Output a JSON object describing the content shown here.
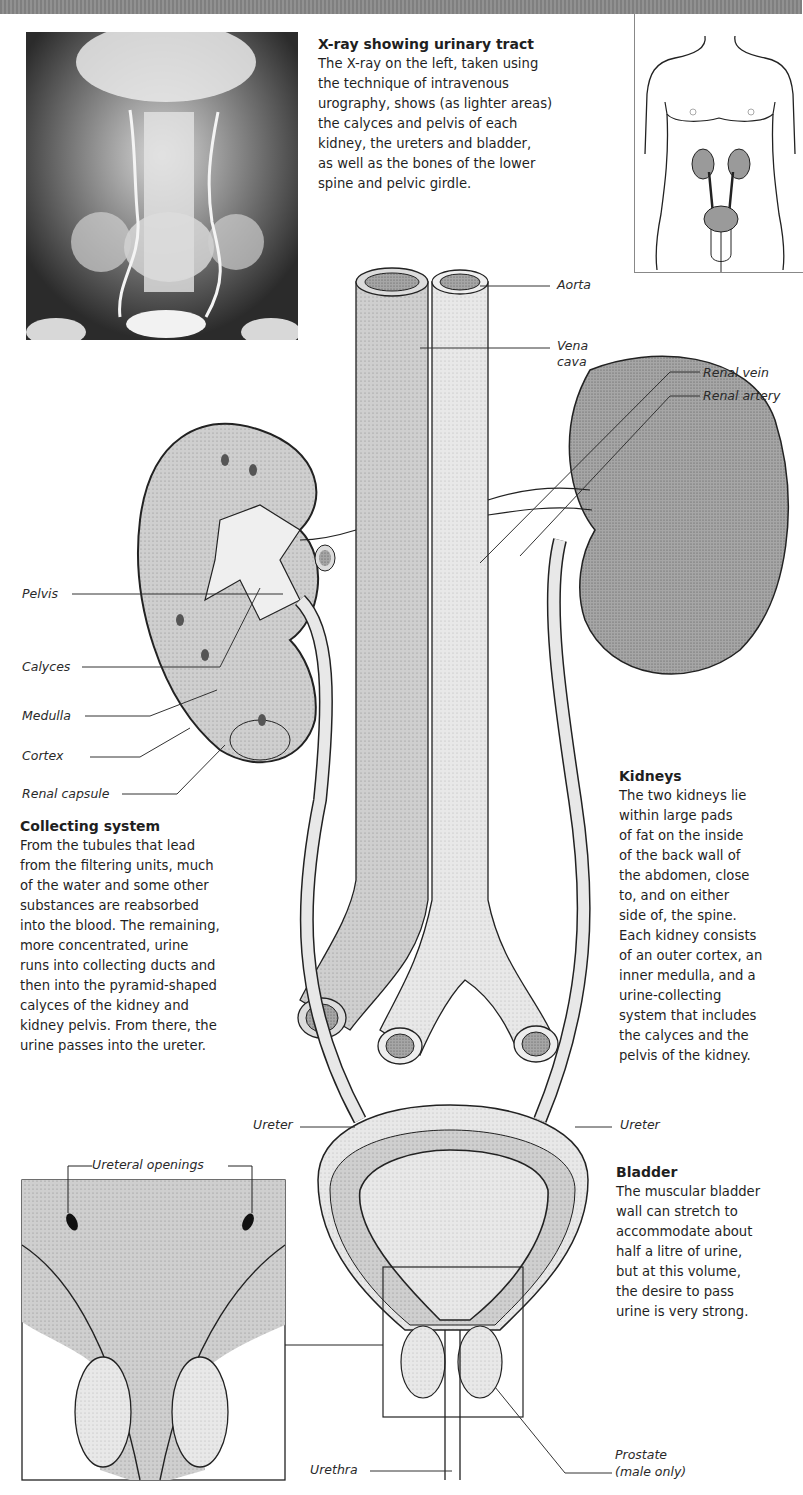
{
  "xray_caption": {
    "title": "X-ray showing urinary tract",
    "lines": [
      "The X-ray on the left, taken using",
      "the technique of intravenous",
      "urography, shows (as lighter areas)",
      "the calyces and pelvis of each",
      "kidney, the ureters and bladder,",
      "as well as the bones of the lower",
      "spine and pelvic girdle."
    ]
  },
  "labels": {
    "aorta": "Aorta",
    "vena_cava_1": "Vena",
    "vena_cava_2": "cava",
    "renal_vein": "Renal vein",
    "renal_artery": "Renal artery",
    "pelvis": "Pelvis",
    "calyces": "Calyces",
    "medulla": "Medulla",
    "cortex": "Cortex",
    "renal_capsule": "Renal capsule",
    "ureter_left": "Ureter",
    "ureter_right": "Ureter",
    "ureteral_openings": "Ureteral openings",
    "urethra": "Urethra",
    "prostate_1": "Prostate",
    "prostate_2": "(male only)"
  },
  "collecting_system": {
    "title": "Collecting system",
    "lines": [
      "From the tubules that lead",
      "from the filtering units, much",
      "of the water and some other",
      "substances are reabsorbed",
      "into the blood. The remaining,",
      "more concentrated, urine",
      "runs into collecting ducts and",
      "then into the pyramid-shaped",
      "calyces of the kidney and",
      "kidney pelvis. From there, the",
      "urine passes into the ureter."
    ]
  },
  "kidneys": {
    "title": "Kidneys",
    "lines": [
      "The two kidneys lie",
      "within large pads",
      "of fat on the inside",
      "of the back wall of",
      "the abdomen, close",
      "to, and on either",
      "side of, the spine.",
      "Each kidney consists",
      "of an outer cortex, an",
      "inner medulla, and a",
      "urine-collecting",
      "system that includes",
      "the calyces and the",
      "pelvis of the kidney."
    ]
  },
  "bladder": {
    "title": "Bladder",
    "lines": [
      "The muscular bladder",
      "wall can stretch to",
      "accommodate about",
      "half a litre of urine,",
      "but at this volume,",
      "the desire to pass",
      "urine is very strong."
    ]
  },
  "colors": {
    "organ_fill": "#c9c9c9",
    "organ_dark": "#9a9a9a",
    "vessel_light": "#e6e6e6",
    "outline": "#222222"
  }
}
